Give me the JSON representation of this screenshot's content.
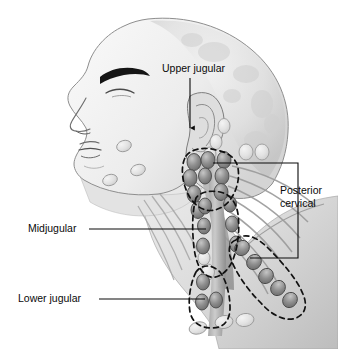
{
  "figure": {
    "view": "left lateral profile",
    "style": "grayscale medical illustration",
    "background_color": "#ffffff",
    "line_color": "#0a0a0a",
    "node_fill_color": "#8a8a8a",
    "node_outline_color": "#4a4a4a",
    "skin_fill_color": "#e8e8e8",
    "muscle_fill_color": "#b0b0b0",
    "dashed_boundary_color": "#111111"
  },
  "labels": [
    {
      "id": "upper-jugular",
      "text": "Upper jugular",
      "x": 162,
      "y": 72,
      "anchor": "start",
      "leader": "vertical line with arrowhead pointing down to node cluster near ear"
    },
    {
      "id": "posterior-cervical",
      "line1": "Posterior",
      "line2": "cervical",
      "x": 280,
      "y": 194,
      "anchor": "start",
      "leader": "bracket with two horizontal leaders joined by a vertical spine"
    },
    {
      "id": "midjugular",
      "text": "Midjugular",
      "x": 28,
      "y": 232,
      "anchor": "start",
      "leader": "horizontal line to mid neck node chain"
    },
    {
      "id": "lower-jugular",
      "text": "Lower jugular",
      "x": 18,
      "y": 302,
      "anchor": "start",
      "leader": "horizontal line to lower neck node chain"
    }
  ],
  "regions": [
    {
      "id": "upper-jugular-region",
      "name": "Upper jugular",
      "description": "dashed oval boundary around superior deep cervical nodes below and behind the ear"
    },
    {
      "id": "midjugular-region",
      "name": "Midjugular",
      "description": "dashed boundary around middle deep cervical node chain along the jugular vein"
    },
    {
      "id": "lower-jugular-region",
      "name": "Lower jugular",
      "description": "dashed boundary around inferior deep cervical node chain at the base of the neck"
    },
    {
      "id": "posterior-cervical-region",
      "name": "Posterior cervical",
      "description": "dashed elongated boundary along the posterior triangle toward the shoulder"
    }
  ]
}
